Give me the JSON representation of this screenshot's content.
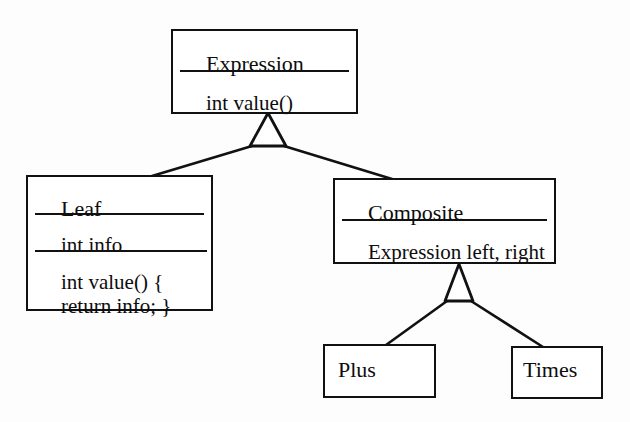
{
  "diagram": {
    "kind": "uml-class-diagram",
    "stroke_color": "#111111",
    "fill_color": "#ffffff",
    "background_color": "#fdfdfd",
    "classes": [
      {
        "id": "expression",
        "name": "Expression",
        "attributes": "",
        "operations": "int value()"
      },
      {
        "id": "leaf",
        "name": "Leaf",
        "attributes": "int info",
        "operations_line1": "int value() {",
        "operations_line2": "return info; }"
      },
      {
        "id": "composite",
        "name": "Composite",
        "attributes": "Expression left, right",
        "operations": ""
      },
      {
        "id": "plus",
        "name": "Plus"
      },
      {
        "id": "times",
        "name": "Times"
      }
    ],
    "generalizations": [
      {
        "id": "leaf-to-expression",
        "child": "Leaf",
        "parent": "Expression",
        "arrow": "hollow-triangle"
      },
      {
        "id": "composite-to-expression",
        "child": "Composite",
        "parent": "Expression",
        "arrow": "hollow-triangle"
      },
      {
        "id": "plus-to-composite",
        "child": "Plus",
        "parent": "Composite",
        "arrow": "hollow-triangle"
      },
      {
        "id": "times-to-composite",
        "child": "Times",
        "parent": "Composite",
        "arrow": "hollow-triangle"
      }
    ]
  }
}
